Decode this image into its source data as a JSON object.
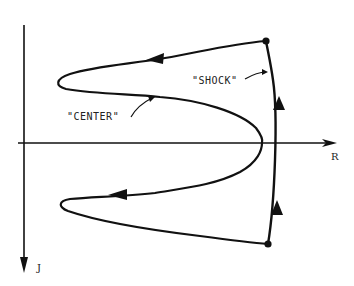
{
  "diagram": {
    "axes": {
      "horizontal": {
        "label": "R",
        "direction": "right"
      },
      "vertical": {
        "label": "J",
        "direction": "down"
      }
    },
    "annotations": [
      {
        "id": "center",
        "text": "\"CENTER\""
      },
      {
        "id": "shock",
        "text": "\"SHOCK\""
      }
    ],
    "colors": {
      "stroke": "#111111",
      "background": "#ffffff"
    },
    "nodes": [
      {
        "id": "top-node",
        "x": 266,
        "y": 41
      },
      {
        "id": "bottom-node",
        "x": 268,
        "y": 244
      }
    ]
  }
}
